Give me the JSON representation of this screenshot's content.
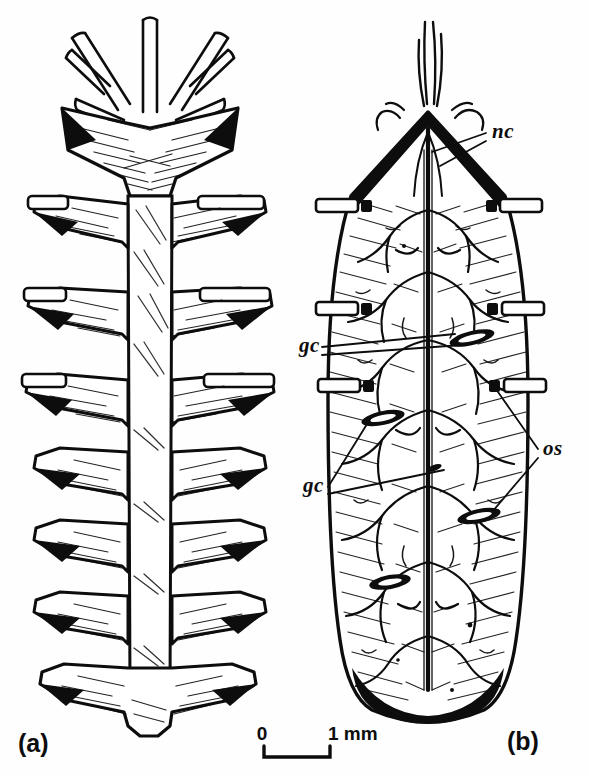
{
  "figure": {
    "kind": "scientific-line-drawing",
    "background_color": "#fefefe",
    "ink_color": "#0d0d0d",
    "width": 589,
    "height": 776
  },
  "panels": [
    {
      "id": "a",
      "label": "(a)",
      "label_x": 18,
      "label_y": 752,
      "description": "segmented body with paired lateral spines and branched tubular appendages at anterior end",
      "segments": 8,
      "tube_pairs": 3
    },
    {
      "id": "b",
      "label": "(b)",
      "label_x": 507,
      "label_y": 750,
      "description": "internal anatomy, ovoid outline with median nerve cord, branching network, gland cells and lateral openings",
      "lateral_opening_pairs": 3,
      "gland_cells": 5
    }
  ],
  "annotations": [
    {
      "id": "nc",
      "text": "nc",
      "x": 492,
      "y": 138,
      "leaders": 2,
      "meaning": "nerve-cord"
    },
    {
      "id": "gc1",
      "text": "gc",
      "x": 299,
      "y": 352,
      "leaders": 2,
      "meaning": "gland-cell"
    },
    {
      "id": "gc2",
      "text": "gc",
      "x": 303,
      "y": 492,
      "leaders": 2,
      "meaning": "gland-cell"
    },
    {
      "id": "os",
      "text": "os",
      "x": 543,
      "y": 455,
      "leaders": 2,
      "meaning": "opening-ostium"
    }
  ],
  "scale_bar": {
    "zero_label": "0",
    "length_label": "1 mm",
    "zero_x": 262,
    "zero_y": 740,
    "length_x": 322,
    "length_y": 740,
    "bar_left": 264,
    "bar_right": 330,
    "bar_y": 752
  }
}
